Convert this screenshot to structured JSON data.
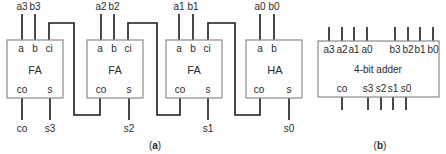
{
  "diagram_a": {
    "caption_open": "(",
    "caption_letter": "a",
    "caption_close": ")",
    "blocks": [
      {
        "name": "FA",
        "inputs": [
          "a3",
          "b3"
        ],
        "port_a": "a",
        "port_b": "b",
        "port_ci": "ci",
        "port_co": "co",
        "port_s": "s",
        "out_co": "co",
        "out_s": "s3"
      },
      {
        "name": "FA",
        "inputs": [
          "a2",
          "b2"
        ],
        "port_a": "a",
        "port_b": "b",
        "port_ci": "ci",
        "port_co": "co",
        "port_s": "s",
        "out_s": "s2"
      },
      {
        "name": "FA",
        "inputs": [
          "a1",
          "b1"
        ],
        "port_a": "a",
        "port_b": "b",
        "port_ci": "ci",
        "port_co": "co",
        "port_s": "s",
        "out_s": "s1"
      },
      {
        "name": "HA",
        "inputs": [
          "a0",
          "b0"
        ],
        "port_a": "a",
        "port_b": "b",
        "port_co": "co",
        "port_s": "s",
        "out_s": "s0"
      }
    ]
  },
  "diagram_b": {
    "caption_open": "(",
    "caption_letter": "b",
    "caption_close": ")",
    "block_name": "4-bit adder",
    "inputs_a": [
      "a3",
      "a2",
      "a1",
      "a0"
    ],
    "inputs_b": [
      "b3",
      "b2",
      "b1",
      "b0"
    ],
    "out_co": "co",
    "outputs_s": [
      "s3",
      "s2",
      "s1",
      "s0"
    ]
  }
}
